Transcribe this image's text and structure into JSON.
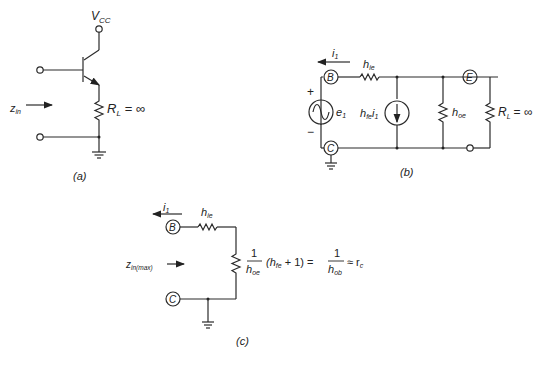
{
  "diagram_a": {
    "caption": "(a)",
    "vcc_label": "V",
    "vcc_sub": "CC",
    "zin_label": "z",
    "zin_sub": "in",
    "rl_label": "R",
    "rl_sub": "L",
    "rl_value": "= ∞"
  },
  "diagram_b": {
    "caption": "(b)",
    "current_label": "i",
    "current_sub": "1",
    "hie_label": "h",
    "hie_sub": "ie",
    "node_b": "B",
    "node_c": "C",
    "node_e": "E",
    "plus": "+",
    "minus": "−",
    "source_label": "e",
    "source_sub": "1",
    "dep_source_label": "h",
    "dep_source_sub": "fe",
    "dep_source_i": "i",
    "dep_source_i_sub": "1",
    "hoe_label": "h",
    "hoe_sub": "oe",
    "rl_label": "R",
    "rl_sub": "L",
    "rl_value": "= ∞"
  },
  "diagram_c": {
    "caption": "(c)",
    "current_label": "i",
    "current_sub": "1",
    "hie_label": "h",
    "hie_sub": "ie",
    "node_b": "B",
    "node_c": "C",
    "zin_label": "z",
    "zin_sub": "in(max)",
    "eq_num": "1",
    "eq_den": "h",
    "eq_den_sub": "oe",
    "eq_mid_h": "(h",
    "eq_mid_sub": "fe",
    "eq_mid_rest": " + 1) =",
    "eq_num2": "1",
    "eq_den2": "h",
    "eq_den2_sub": "ob",
    "eq_approx": "≈ r",
    "eq_approx_sub": "c"
  }
}
